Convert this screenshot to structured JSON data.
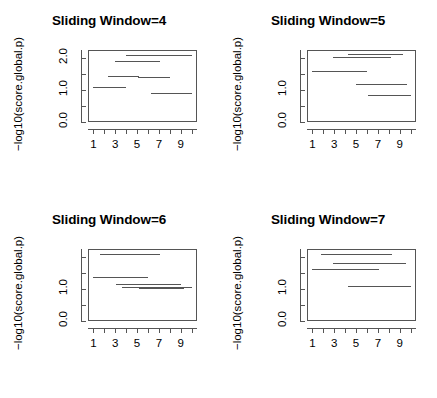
{
  "figure": {
    "layout": "2x2 panel grid",
    "background": "#ffffff",
    "line_color": "#555555"
  },
  "axis_common": {
    "ylabel": "−log10(score.global.p)",
    "xticks": [
      1,
      2,
      3,
      4,
      5,
      6,
      7,
      8,
      9,
      10
    ],
    "xtick_labels": [
      "1",
      "",
      "3",
      "",
      "5",
      "",
      "7",
      "",
      "9",
      ""
    ],
    "yticks": [
      0.0,
      0.5,
      1.0,
      1.5,
      2.0
    ],
    "xlim": [
      0.5,
      10.5
    ],
    "ylim": [
      0.0,
      2.25
    ]
  },
  "panels": [
    {
      "id": "panel-sliding-window-4",
      "title": "Sliding Window=4",
      "ytick_labels": [
        "0.0",
        "",
        "1.0",
        "",
        "2.0"
      ],
      "segments": [
        {
          "x_start": 4.0,
          "x_end": 10.0,
          "y": 2.1
        },
        {
          "x_start": 3.0,
          "x_end": 7.1,
          "y": 1.9
        },
        {
          "x_start": 2.3,
          "x_end": 5.2,
          "y": 1.45
        },
        {
          "x_start": 5.1,
          "x_end": 8.0,
          "y": 1.42
        },
        {
          "x_start": 1.0,
          "x_end": 4.0,
          "y": 1.1
        },
        {
          "x_start": 6.3,
          "x_end": 10.0,
          "y": 0.92
        }
      ]
    },
    {
      "id": "panel-sliding-window-5",
      "title": "Sliding Window=5",
      "ytick_labels": [
        "0.0",
        "",
        "1.0",
        "",
        ""
      ],
      "segments": [
        {
          "x_start": 4.3,
          "x_end": 9.3,
          "y": 2.14
        },
        {
          "x_start": 2.9,
          "x_end": 8.2,
          "y": 2.02
        },
        {
          "x_start": 1.0,
          "x_end": 6.0,
          "y": 1.58
        },
        {
          "x_start": 5.0,
          "x_end": 9.7,
          "y": 1.18
        },
        {
          "x_start": 6.1,
          "x_end": 10.0,
          "y": 0.85
        }
      ]
    },
    {
      "id": "panel-sliding-window-6",
      "title": "Sliding Window=6",
      "ytick_labels": [
        "0.0",
        "",
        "1.0",
        "",
        ""
      ],
      "segments": [
        {
          "x_start": 1.6,
          "x_end": 7.1,
          "y": 2.1
        },
        {
          "x_start": 1.0,
          "x_end": 6.0,
          "y": 1.38
        },
        {
          "x_start": 3.1,
          "x_end": 9.0,
          "y": 1.15
        },
        {
          "x_start": 3.6,
          "x_end": 10.0,
          "y": 1.05
        },
        {
          "x_start": 5.2,
          "x_end": 9.3,
          "y": 1.02
        }
      ]
    },
    {
      "id": "panel-sliding-window-7",
      "title": "Sliding Window=7",
      "ytick_labels": [
        "0.0",
        "",
        "1.0",
        "",
        ""
      ],
      "segments": [
        {
          "x_start": 1.8,
          "x_end": 8.3,
          "y": 2.08
        },
        {
          "x_start": 2.9,
          "x_end": 9.6,
          "y": 1.8
        },
        {
          "x_start": 1.0,
          "x_end": 7.1,
          "y": 1.62
        },
        {
          "x_start": 4.3,
          "x_end": 10.0,
          "y": 1.1
        }
      ]
    }
  ],
  "chart_data": {
    "type": "line",
    "xlabel": "",
    "ylabel": "−log10(score.global.p)",
    "xlim": [
      0.5,
      10.5
    ],
    "ylim": [
      0.0,
      2.25
    ],
    "grid": false,
    "legend": "none",
    "subplots": [
      {
        "title": "Sliding Window=4",
        "x_tick_labels": [
          "1",
          "3",
          "5",
          "7",
          "9"
        ],
        "y_tick_labels": [
          "0.0",
          "1.0",
          "2.0"
        ],
        "segments": [
          {
            "x_start": 4.0,
            "x_end": 10.0,
            "y": 2.1
          },
          {
            "x_start": 3.0,
            "x_end": 7.1,
            "y": 1.9
          },
          {
            "x_start": 2.3,
            "x_end": 5.2,
            "y": 1.45
          },
          {
            "x_start": 5.1,
            "x_end": 8.0,
            "y": 1.42
          },
          {
            "x_start": 1.0,
            "x_end": 4.0,
            "y": 1.1
          },
          {
            "x_start": 6.3,
            "x_end": 10.0,
            "y": 0.92
          }
        ]
      },
      {
        "title": "Sliding Window=5",
        "x_tick_labels": [
          "1",
          "3",
          "5",
          "7",
          "9"
        ],
        "y_tick_labels": [
          "0.0",
          "1.0"
        ],
        "segments": [
          {
            "x_start": 4.3,
            "x_end": 9.3,
            "y": 2.14
          },
          {
            "x_start": 2.9,
            "x_end": 8.2,
            "y": 2.02
          },
          {
            "x_start": 1.0,
            "x_end": 6.0,
            "y": 1.58
          },
          {
            "x_start": 5.0,
            "x_end": 9.7,
            "y": 1.18
          },
          {
            "x_start": 6.1,
            "x_end": 10.0,
            "y": 0.85
          }
        ]
      },
      {
        "title": "Sliding Window=6",
        "x_tick_labels": [
          "1",
          "3",
          "5",
          "7",
          "9"
        ],
        "y_tick_labels": [
          "0.0",
          "1.0"
        ],
        "segments": [
          {
            "x_start": 1.6,
            "x_end": 7.1,
            "y": 2.1
          },
          {
            "x_start": 1.0,
            "x_end": 6.0,
            "y": 1.38
          },
          {
            "x_start": 3.1,
            "x_end": 9.0,
            "y": 1.15
          },
          {
            "x_start": 3.6,
            "x_end": 10.0,
            "y": 1.05
          },
          {
            "x_start": 5.2,
            "x_end": 9.3,
            "y": 1.02
          }
        ]
      },
      {
        "title": "Sliding Window=7",
        "x_tick_labels": [
          "1",
          "3",
          "5",
          "7",
          "9"
        ],
        "y_tick_labels": [
          "0.0",
          "1.0"
        ],
        "segments": [
          {
            "x_start": 1.8,
            "x_end": 8.3,
            "y": 2.08
          },
          {
            "x_start": 2.9,
            "x_end": 9.6,
            "y": 1.8
          },
          {
            "x_start": 1.0,
            "x_end": 7.1,
            "y": 1.62
          },
          {
            "x_start": 4.3,
            "x_end": 10.0,
            "y": 1.1
          }
        ]
      }
    ]
  }
}
